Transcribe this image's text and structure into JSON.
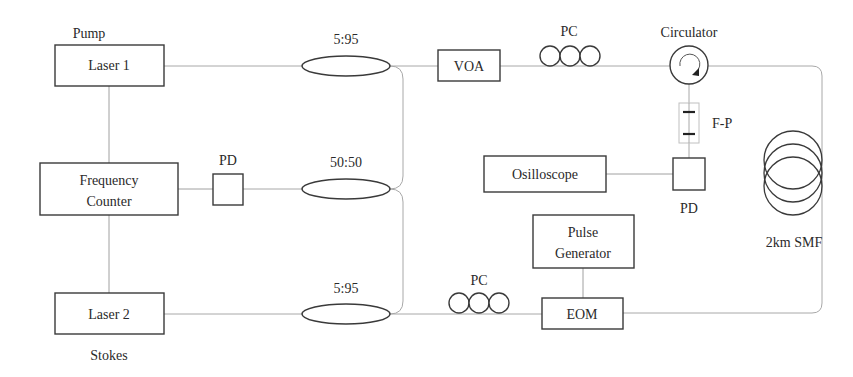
{
  "diagram": {
    "type": "optical experimental setup",
    "components": {
      "laser1": {
        "label": "Laser 1",
        "annotation": "Pump"
      },
      "laser2": {
        "label": "Laser 2",
        "annotation": "Stokes"
      },
      "freq_counter": {
        "line1": "Frequency",
        "line2": "Counter"
      },
      "pd_left": {
        "label": "PD"
      },
      "coupler_top": {
        "label": "5:95"
      },
      "coupler_mid": {
        "label": "50:50"
      },
      "coupler_bottom": {
        "label": "5:95"
      },
      "voa": {
        "label": "VOA"
      },
      "pc_top": {
        "label": "PC"
      },
      "pc_bottom": {
        "label": "PC"
      },
      "circulator": {
        "label": "Circulator"
      },
      "fp": {
        "label": "F-P"
      },
      "pd_right": {
        "label": "PD"
      },
      "oscilloscope": {
        "label": "Osilloscope"
      },
      "pulse_gen": {
        "line1": "Pulse",
        "line2": "Generator"
      },
      "eom": {
        "label": "EOM"
      },
      "smf": {
        "label": "2km SMF"
      }
    },
    "connections": [
      [
        "laser1",
        "coupler_top"
      ],
      [
        "coupler_top",
        "voa"
      ],
      [
        "voa",
        "pc_top"
      ],
      [
        "pc_top",
        "circulator"
      ],
      [
        "circulator",
        "smf"
      ],
      [
        "smf",
        "eom"
      ],
      [
        "circulator",
        "fp"
      ],
      [
        "fp",
        "pd_right"
      ],
      [
        "pd_right",
        "oscilloscope"
      ],
      [
        "coupler_top",
        "coupler_mid"
      ],
      [
        "coupler_bottom",
        "coupler_mid"
      ],
      [
        "coupler_mid",
        "pd_left"
      ],
      [
        "pd_left",
        "freq_counter"
      ],
      [
        "laser1",
        "freq_counter"
      ],
      [
        "freq_counter",
        "laser2"
      ],
      [
        "laser2",
        "coupler_bottom"
      ],
      [
        "coupler_bottom",
        "pc_bottom"
      ],
      [
        "pc_bottom",
        "eom"
      ],
      [
        "pulse_gen",
        "eom"
      ]
    ]
  }
}
